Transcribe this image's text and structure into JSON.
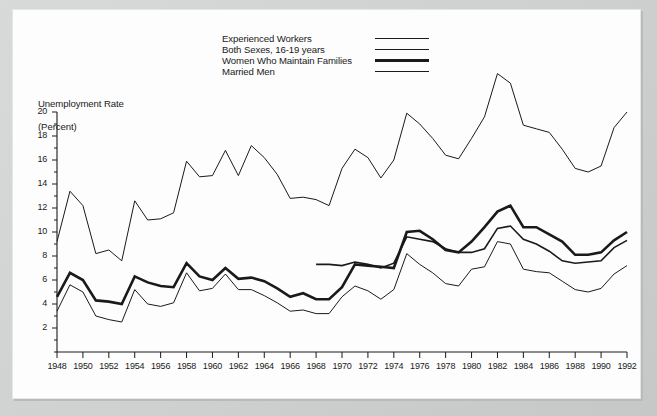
{
  "figure": {
    "background_color": "#c9cbcb",
    "plate_color": "#fdfdfd",
    "ink_color": "#1a1a1a"
  },
  "legend": {
    "position": "top-center",
    "entries": [
      {
        "label": "Experienced Workers",
        "line_width": 1.0,
        "swatch_name": "legend-swatch-experienced-workers"
      },
      {
        "label": "Both Sexes, 16-19 years",
        "line_width": 1.0,
        "swatch_name": "legend-swatch-both-sexes-16-19"
      },
      {
        "label": "Women Who Maintain Families",
        "line_width": 2.6,
        "swatch_name": "legend-swatch-women-maintain-families"
      },
      {
        "label": "Married Men",
        "line_width": 1.6,
        "swatch_name": "legend-swatch-married-men"
      }
    ]
  },
  "chart_data": {
    "type": "line",
    "title": "",
    "subtitle": "",
    "xlabel": "",
    "ylabel": "Unemployment Rate\n(Percent)",
    "ylabel_line1": "Unemployment Rate",
    "ylabel_line2": "(Percent)",
    "grid": false,
    "xlim": [
      1948,
      1992
    ],
    "ylim": [
      0,
      20
    ],
    "ytick_labels": [
      "2",
      "4",
      "6",
      "8",
      "10",
      "12",
      "14",
      "16",
      "18",
      "20"
    ],
    "yticks": [
      2,
      4,
      6,
      8,
      10,
      12,
      14,
      16,
      18,
      20
    ],
    "yticks_minor_step": 1,
    "xtick_labels": [
      "1948",
      "1950",
      "1952",
      "1954",
      "1956",
      "1958",
      "1960",
      "1962",
      "1964",
      "1966",
      "1968",
      "1970",
      "1972",
      "1974",
      "1976",
      "1978",
      "1980",
      "1982",
      "1984",
      "1986",
      "1988",
      "1990",
      "1992"
    ],
    "xticks": [
      1948,
      1950,
      1952,
      1954,
      1956,
      1958,
      1960,
      1962,
      1964,
      1966,
      1968,
      1970,
      1972,
      1974,
      1976,
      1978,
      1980,
      1982,
      1984,
      1986,
      1988,
      1990,
      1992
    ],
    "axis_color": "#1a1a1a",
    "series": [
      {
        "name": "Both Sexes, 16-19 years",
        "line_width": 1.0,
        "color": "#1a1a1a",
        "x": [
          1948,
          1949,
          1950,
          1951,
          1952,
          1953,
          1954,
          1955,
          1956,
          1957,
          1958,
          1959,
          1960,
          1961,
          1962,
          1963,
          1964,
          1965,
          1966,
          1967,
          1968,
          1969,
          1970,
          1971,
          1972,
          1973,
          1974,
          1975,
          1976,
          1977,
          1978,
          1979,
          1980,
          1981,
          1982,
          1983,
          1984,
          1985,
          1986,
          1987,
          1988,
          1989,
          1990,
          1991,
          1992
        ],
        "values": [
          9.2,
          13.4,
          12.2,
          8.2,
          8.5,
          7.6,
          12.6,
          11.0,
          11.1,
          11.6,
          15.9,
          14.6,
          14.7,
          16.8,
          14.7,
          17.2,
          16.2,
          14.8,
          12.8,
          12.9,
          12.7,
          12.2,
          15.3,
          16.9,
          16.2,
          14.5,
          16.0,
          19.9,
          19.0,
          17.8,
          16.4,
          16.1,
          17.8,
          19.6,
          23.2,
          22.4,
          18.9,
          18.6,
          18.3,
          16.9,
          15.3,
          15.0,
          15.5,
          18.7,
          20.0
        ]
      },
      {
        "name": "Experienced Workers",
        "line_width": 1.0,
        "color": "#1a1a1a",
        "x": [
          1948,
          1949,
          1950,
          1951,
          1952,
          1953,
          1954,
          1955,
          1956,
          1957,
          1958,
          1959,
          1960,
          1961,
          1962,
          1963,
          1964,
          1965,
          1966,
          1967,
          1968,
          1969,
          1970,
          1971,
          1972,
          1973,
          1974,
          1975,
          1976,
          1977,
          1978,
          1979,
          1980,
          1981,
          1982,
          1983,
          1984,
          1985,
          1986,
          1987,
          1988,
          1989,
          1990,
          1991,
          1992
        ],
        "values": [
          3.4,
          5.6,
          5.0,
          3.0,
          2.7,
          2.5,
          5.2,
          4.0,
          3.8,
          4.1,
          6.6,
          5.1,
          5.3,
          6.5,
          5.2,
          5.2,
          4.7,
          4.1,
          3.4,
          3.5,
          3.2,
          3.2,
          4.6,
          5.5,
          5.1,
          4.4,
          5.2,
          8.2,
          7.3,
          6.6,
          5.7,
          5.5,
          6.9,
          7.1,
          9.2,
          9.0,
          6.9,
          6.7,
          6.6,
          5.9,
          5.2,
          5.0,
          5.3,
          6.5,
          7.2
        ]
      },
      {
        "name": "Women Who Maintain Families",
        "line_width": 2.6,
        "color": "#1a1a1a",
        "x": [
          1948,
          1949,
          1950,
          1951,
          1952,
          1953,
          1954,
          1955,
          1956,
          1957,
          1958,
          1959,
          1960,
          1961,
          1962,
          1963,
          1964,
          1965,
          1966,
          1967,
          1968,
          1969,
          1970,
          1971,
          1972,
          1973,
          1974,
          1975,
          1976,
          1977,
          1978,
          1979,
          1980,
          1981,
          1982,
          1983,
          1984,
          1985,
          1986,
          1987,
          1988,
          1989,
          1990,
          1991,
          1992
        ],
        "values": [
          4.6,
          6.6,
          6.0,
          4.3,
          4.2,
          4.0,
          6.3,
          5.8,
          5.5,
          5.4,
          7.4,
          6.3,
          6.0,
          7.0,
          6.1,
          6.2,
          5.9,
          5.3,
          4.6,
          4.9,
          4.4,
          4.4,
          5.4,
          7.3,
          7.2,
          7.1,
          7.0,
          10.0,
          10.1,
          9.4,
          8.5,
          8.3,
          9.2,
          10.4,
          11.7,
          12.2,
          10.4,
          10.4,
          9.8,
          9.2,
          8.1,
          8.1,
          8.3,
          9.3,
          10.0
        ]
      },
      {
        "name": "Married Men",
        "line_width": 1.6,
        "color": "#1a1a1a",
        "x": [
          1968,
          1969,
          1970,
          1971,
          1972,
          1973,
          1974,
          1975,
          1976,
          1977,
          1978,
          1979,
          1980,
          1981,
          1982,
          1983,
          1984,
          1985,
          1986,
          1987,
          1988,
          1989,
          1990,
          1991,
          1992
        ],
        "values": [
          7.3,
          7.3,
          7.2,
          7.5,
          7.3,
          7.0,
          7.4,
          9.6,
          9.4,
          9.2,
          8.6,
          8.3,
          8.3,
          8.6,
          10.3,
          10.5,
          9.4,
          9.0,
          8.4,
          7.6,
          7.4,
          7.5,
          7.6,
          8.7,
          9.3
        ]
      }
    ],
    "series_note": "Lines are all black; distinguished only by stroke weight. The Married Men series begins in 1968."
  }
}
